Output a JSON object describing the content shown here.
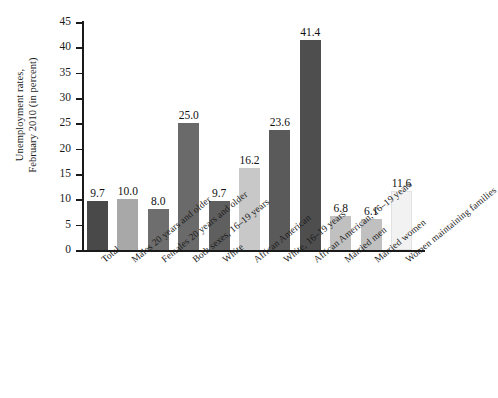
{
  "chart_data": {
    "type": "bar",
    "title": "",
    "xlabel": "",
    "ylabel": "Unemployment rates, February 2010 (in percent)",
    "ylabel_lines": [
      "Unemployment rates,",
      "February 2010 (in percent)"
    ],
    "ylim": [
      0,
      45
    ],
    "ytick_step": 5,
    "yticks": [
      "0",
      "5",
      "10",
      "15",
      "20",
      "25",
      "30",
      "35",
      "40",
      "45"
    ],
    "grid": false,
    "legend": false,
    "categories": [
      "Total",
      "Males 20 years and older",
      "Females 20 years and older",
      "Both sexes, 16–19 years",
      "White",
      "African American",
      "White, 16–19 years",
      "African American, 16–19 years",
      "Married men",
      "Married women",
      "Women maintaining families"
    ],
    "values": [
      9.7,
      10.0,
      8.0,
      25.0,
      9.7,
      16.2,
      23.6,
      41.4,
      6.8,
      6.1,
      11.6
    ],
    "value_labels": [
      "9.7",
      "10.0",
      "8.0",
      "25.0",
      "9.7",
      "16.2",
      "23.6",
      "41.4",
      "6.8",
      "6.1",
      "11.6"
    ],
    "bar_colors": [
      "#494949",
      "#a8a8a8",
      "#6e6e6e",
      "#6a6a6a",
      "#5f5f5f",
      "#c8c8c8",
      "#5a5a5a",
      "#4e4e4e",
      "#c0c0c0",
      "#c0c0c0",
      "#f2f2f2"
    ],
    "axis_color": "#1a1a1a",
    "background_color": "#ffffff"
  }
}
